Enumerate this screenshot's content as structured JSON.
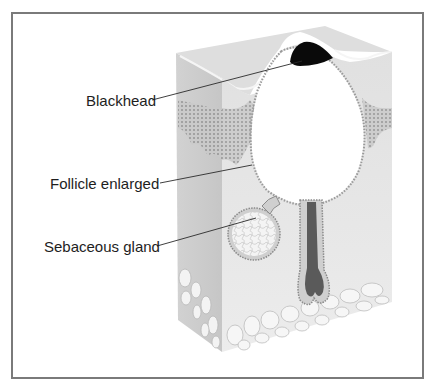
{
  "figure": {
    "labels": [
      {
        "id": "blackhead",
        "text": "Blackhead"
      },
      {
        "id": "follicle",
        "text": "Follicle enlarged"
      },
      {
        "id": "sebaceous",
        "text": "Sebaceous gland"
      }
    ]
  },
  "colors": {
    "frame": "#7a7a7a",
    "skin_side": "#d6d6d6",
    "skin_front": "#e4e4e4",
    "skin_top": "#dcdcdc",
    "epidermis_dots": "#8a8a8a",
    "blackhead": "#0a0a0a",
    "hair_bulb": "#5a5a5a",
    "label_text": "#1e1e1e"
  }
}
